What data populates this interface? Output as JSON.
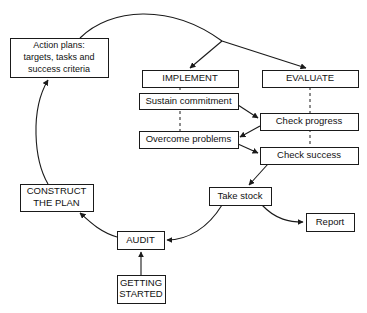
{
  "diagram": {
    "type": "flowchart",
    "background_color": "#ffffff",
    "line_color": "#1a1a1a",
    "box_fill": "#ffffff",
    "nodes": [
      {
        "id": "action-plans",
        "lines": [
          "Action plans:",
          "targets, tasks and",
          "success criteria"
        ],
        "x": 10,
        "y": 38,
        "w": 98,
        "h": 39,
        "style": "multiline"
      },
      {
        "id": "implement",
        "lines": [
          "IMPLEMENT"
        ],
        "x": 142,
        "y": 70,
        "w": 96,
        "h": 17,
        "style": "phase"
      },
      {
        "id": "evaluate",
        "lines": [
          "EVALUATE"
        ],
        "x": 262,
        "y": 70,
        "w": 96,
        "h": 17,
        "style": "phase"
      },
      {
        "id": "sustain-commitment",
        "lines": [
          "Sustain commitment"
        ],
        "x": 139,
        "y": 93,
        "w": 99,
        "h": 16,
        "style": "task"
      },
      {
        "id": "check-progress",
        "lines": [
          "Check progress"
        ],
        "x": 260,
        "y": 113,
        "w": 98,
        "h": 17,
        "style": "task"
      },
      {
        "id": "overcome-problems",
        "lines": [
          "Overcome problems"
        ],
        "x": 139,
        "y": 131,
        "w": 99,
        "h": 17,
        "style": "task"
      },
      {
        "id": "check-success",
        "lines": [
          "Check success"
        ],
        "x": 260,
        "y": 147,
        "w": 98,
        "h": 17,
        "style": "task"
      },
      {
        "id": "construct-the-plan",
        "lines": [
          "CONSTRUCT",
          "THE PLAN"
        ],
        "x": 20,
        "y": 184,
        "w": 73,
        "h": 27,
        "style": "phase"
      },
      {
        "id": "take-stock",
        "lines": [
          "Take stock"
        ],
        "x": 209,
        "y": 187,
        "w": 62,
        "h": 18,
        "style": "task"
      },
      {
        "id": "report",
        "lines": [
          "Report"
        ],
        "x": 306,
        "y": 213,
        "w": 48,
        "h": 18,
        "style": "task"
      },
      {
        "id": "audit",
        "lines": [
          "AUDIT"
        ],
        "x": 117,
        "y": 231,
        "w": 47,
        "h": 18,
        "style": "phase"
      },
      {
        "id": "getting-started",
        "lines": [
          "GETTING",
          "STARTED"
        ],
        "x": 117,
        "y": 275,
        "w": 48,
        "h": 28,
        "style": "phase"
      }
    ],
    "connectors": [
      {
        "id": "action-plans-to-fork",
        "from": "action-plans",
        "to": "fork-point",
        "kind": "curve",
        "arrow": false,
        "path": "M 80,38 C 110,8 170,3 222,41"
      },
      {
        "id": "fork-to-implement",
        "from": "fork-point",
        "to": "implement",
        "kind": "line",
        "arrow": true,
        "path": "M 222,41 L 190,68"
      },
      {
        "id": "fork-to-evaluate",
        "from": "fork-point",
        "to": "evaluate",
        "kind": "line",
        "arrow": true,
        "path": "M 222,41 L 306,68"
      },
      {
        "id": "implement-dashed-down",
        "from": "implement",
        "to": "overcome-problems",
        "kind": "dashed",
        "arrow": false,
        "path": "M 180,87 L 180,131"
      },
      {
        "id": "evaluate-dashed-down",
        "from": "evaluate",
        "to": "check-success",
        "kind": "dashed",
        "arrow": false,
        "path": "M 310,87 L 310,147"
      },
      {
        "id": "sustain-to-check-progress",
        "from": "sustain-commitment",
        "to": "check-progress",
        "kind": "line",
        "arrow": true,
        "path": "M 238,105 L 258,118"
      },
      {
        "id": "check-progress-to-overcome",
        "from": "check-progress",
        "to": "overcome-problems",
        "kind": "line",
        "arrow": true,
        "path": "M 260,126 L 240,137"
      },
      {
        "id": "overcome-to-check-success",
        "from": "overcome-problems",
        "to": "check-success",
        "kind": "line",
        "arrow": true,
        "path": "M 238,144 L 258,153"
      },
      {
        "id": "check-success-to-take-stock",
        "from": "check-success",
        "to": "take-stock",
        "kind": "line",
        "arrow": true,
        "path": "M 268,164 L 249,185"
      },
      {
        "id": "take-stock-to-report",
        "from": "take-stock",
        "to": "report",
        "kind": "curve",
        "arrow": true,
        "path": "M 262,205 C 276,220 290,222 303,222"
      },
      {
        "id": "take-stock-to-audit",
        "from": "take-stock",
        "to": "audit",
        "kind": "curve",
        "arrow": true,
        "path": "M 222,205 C 208,228 188,240 167,240"
      },
      {
        "id": "audit-to-construct",
        "from": "audit",
        "to": "construct-the-plan",
        "kind": "curve",
        "arrow": true,
        "path": "M 117,237 C 100,232 90,222 80,213"
      },
      {
        "id": "construct-to-action-plans",
        "from": "construct-the-plan",
        "to": "action-plans",
        "kind": "curve",
        "arrow": true,
        "path": "M 48,184 C 34,160 30,110 48,80"
      },
      {
        "id": "getting-started-to-audit",
        "from": "getting-started",
        "to": "audit",
        "kind": "line",
        "arrow": true,
        "path": "M 141,275 L 141,252"
      }
    ]
  }
}
